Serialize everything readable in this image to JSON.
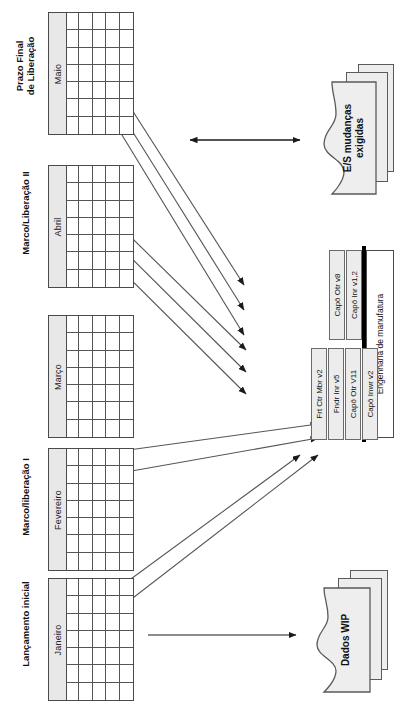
{
  "diagram": {
    "orientation": "rotated-90-ccw"
  },
  "calendars": [
    {
      "header": "Lançamento inicial",
      "header_line2": "",
      "month": "Janeiro",
      "id": "cal-janeiro"
    },
    {
      "header": "Marco/liberação I",
      "header_line2": "",
      "month": "Fevereiro",
      "id": "cal-fevereiro"
    },
    {
      "header": "",
      "header_line2": "",
      "month": "Março",
      "id": "cal-marco"
    },
    {
      "header": "Marco/Liberação II",
      "header_line2": "",
      "month": "Abril",
      "id": "cal-abril"
    },
    {
      "header": "Prazo Final",
      "header_line2": "de Liberação",
      "month": "Maio",
      "id": "cal-maio"
    }
  ],
  "engineering": {
    "label": "Engenharia de manufatura",
    "group_left": [
      {
        "label": "Frt Ctr Mbr v2"
      },
      {
        "label": "Fndr Inr v5"
      },
      {
        "label": "Capô Otr V11"
      },
      {
        "label": "Capô Inwr v2"
      }
    ],
    "group_right": [
      {
        "label": "Capô Otr v8"
      },
      {
        "label": "Capô Inr v1,2"
      }
    ]
  },
  "documents": [
    {
      "id": "doc-dados-wip",
      "label": "Dados WIP",
      "label_line2": ""
    },
    {
      "id": "doc-es-mudancas",
      "label": "E/S mudanças",
      "label_line2": "exigidas"
    }
  ],
  "connectors": {
    "bidirectional_label": "",
    "count_milestone_arrows": 6,
    "count_wip_arrows": 2,
    "count_plain_arrows": 1
  },
  "colors": {
    "band_fill": "#e8e8e8",
    "part_fill": "#ececec",
    "doc_fill": "#ededed",
    "line": "#555555",
    "bar": "#000000"
  }
}
